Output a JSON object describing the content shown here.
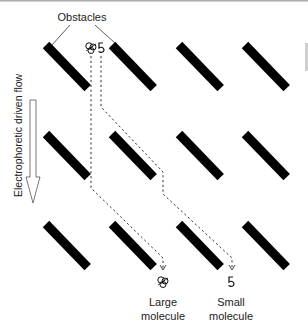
{
  "diagram": {
    "title_label": "Obstacles",
    "flow_label": "Electrophoretic driven flow",
    "molecules": [
      {
        "name": "large",
        "label_line1": "Large",
        "label_line2": "molecule",
        "symbol": "large-molecule-icon"
      },
      {
        "name": "small",
        "label_line1": "Small",
        "label_line2": "molecule",
        "symbol": "small-molecule-icon"
      }
    ],
    "obstacle_grid": {
      "rows": 3,
      "cols": 4
    },
    "colors": {
      "obstacle": "#000000",
      "path": "#333333",
      "text": "#222222",
      "arrow_outline": "#555555"
    }
  }
}
